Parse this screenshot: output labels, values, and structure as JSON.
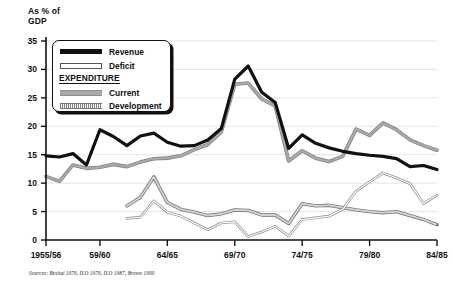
{
  "chart_data": {
    "type": "line",
    "title": "",
    "ylabel": "As % of\nGDP",
    "xlabel": "",
    "ylim": [
      0,
      35
    ],
    "yticks": [
      0,
      5,
      10,
      15,
      20,
      25,
      30,
      35
    ],
    "grid": true,
    "grid_axis": "y",
    "legend_position": "upper-left",
    "legend_group_heading": "EXPENDITURE",
    "x": [
      "1955/56",
      "1956/57",
      "1957/58",
      "1958/59",
      "1959/60",
      "1960/61",
      "1961/62",
      "1962/63",
      "1963/64",
      "1964/65",
      "1965/66",
      "1966/67",
      "1967/68",
      "1968/69",
      "1969/70",
      "1970/71",
      "1971/72",
      "1972/73",
      "1973/74",
      "1974/75",
      "1975/76",
      "1976/77",
      "1977/78",
      "1978/79",
      "1979/80",
      "1980/81",
      "1981/82",
      "1982/83",
      "1983/84",
      "1984/85"
    ],
    "xticks": [
      "1955/56",
      "59/60",
      "64/65",
      "69/70",
      "74/75",
      "79/80",
      "84/85"
    ],
    "xtick_positions": [
      0,
      4,
      9,
      14,
      19,
      24,
      29
    ],
    "series": [
      {
        "name": "Revenue",
        "color": "#111111",
        "style": "thick-solid",
        "values": [
          14.8,
          14.6,
          15.2,
          13.2,
          19.4,
          18.2,
          16.6,
          18.3,
          18.8,
          17.2,
          16.5,
          16.6,
          17.6,
          19.6,
          28.3,
          30.6,
          26.0,
          24.2,
          16.1,
          18.5,
          17.0,
          16.2,
          15.6,
          15.2,
          14.9,
          14.7,
          14.3,
          12.9,
          13.1,
          12.4
        ]
      },
      {
        "name": "Deficit",
        "color": "#ffffff",
        "outline": "#8a8a8a",
        "style": "thin-outline",
        "values": [
          null,
          null,
          null,
          null,
          null,
          null,
          3.8,
          4.0,
          6.9,
          4.9,
          4.2,
          3.0,
          1.8,
          3.0,
          3.2,
          0.6,
          1.4,
          2.4,
          0.7,
          3.6,
          3.9,
          4.2,
          5.4,
          8.6,
          10.2,
          11.8,
          10.9,
          9.9,
          6.4,
          7.9
        ]
      },
      {
        "name": "Current",
        "color": "#a8a8a8",
        "style": "grey-solid",
        "values": [
          11.2,
          10.3,
          13.2,
          12.6,
          12.8,
          13.3,
          12.9,
          13.7,
          14.3,
          14.4,
          14.8,
          15.9,
          16.8,
          19.0,
          27.4,
          27.6,
          24.8,
          23.6,
          13.9,
          15.7,
          14.4,
          13.8,
          14.7,
          19.5,
          18.4,
          20.6,
          19.4,
          17.6,
          16.6,
          15.8
        ]
      },
      {
        "name": "Development",
        "color": "#b0b0b0",
        "style": "dotted-band",
        "values": [
          null,
          null,
          null,
          null,
          null,
          null,
          6.0,
          7.5,
          11.1,
          6.6,
          5.4,
          4.9,
          4.3,
          4.6,
          5.3,
          5.2,
          4.4,
          4.4,
          2.9,
          6.4,
          6.0,
          6.1,
          5.7,
          5.3,
          5.0,
          4.8,
          5.0,
          4.3,
          3.6,
          2.7
        ]
      }
    ],
    "source_note": "Sources: Beshai 1976, ILO 1976, ILO 1987, Brown 1990"
  },
  "legend": {
    "items": [
      {
        "label": "Revenue"
      },
      {
        "label": "Deficit"
      },
      {
        "label": "Current"
      },
      {
        "label": "Development"
      }
    ],
    "heading": "EXPENDITURE"
  },
  "axes": {
    "y_title": "As % of\nGDP",
    "y_ticks": [
      "0",
      "5",
      "10",
      "15",
      "20",
      "25",
      "30",
      "35"
    ],
    "x_ticks": [
      "1955/56",
      "59/60",
      "64/65",
      "69/70",
      "74/75",
      "79/80",
      "84/85"
    ]
  },
  "footer": {
    "source": "Sources: Beshai 1976, ILO 1976, ILO 1987, Brown 1990"
  },
  "colors": {
    "revenue": "#111111",
    "deficit_fill": "#ffffff",
    "deficit_stroke": "#8a8a8a",
    "current": "#a8a8a8",
    "development": "#b0b0b0",
    "axis": "#111111",
    "grid": "#e2e2e2",
    "background": "#ffffff"
  }
}
